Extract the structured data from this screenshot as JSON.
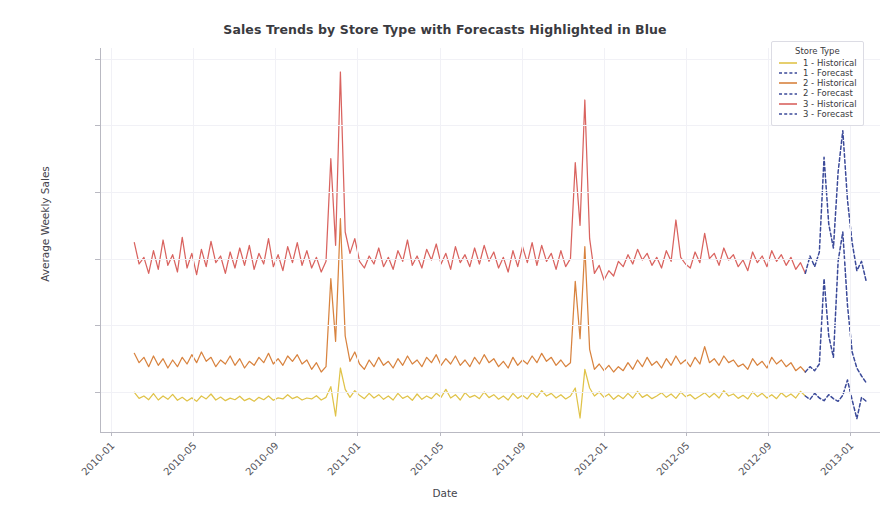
{
  "chart_data": {
    "type": "line",
    "title": "Sales Trends by Store Type with Forecasts Highlighted in Blue",
    "xlabel": "Date",
    "ylabel": "Average Weekly Sales",
    "grid": true,
    "legend_position": "upper right",
    "legend_title": "Store Type",
    "ylim": [
      7000,
      35800
    ],
    "yticks": [
      10000,
      15000,
      20000,
      25000,
      30000,
      35000
    ],
    "ytick_labels": [
      "10000",
      "15000",
      "20000",
      "25000",
      "30000",
      "35000"
    ],
    "xlim": [
      "2009-12-15",
      "2013-02-15"
    ],
    "xticks": [
      "2010-01",
      "2010-05",
      "2010-09",
      "2011-01",
      "2011-05",
      "2011-09",
      "2012-01",
      "2012-05",
      "2012-09",
      "2013-01"
    ],
    "colors": {
      "type1_historical": "#e0c349",
      "type2_historical": "#d8833f",
      "type3_historical": "#d9635f",
      "forecast": "#3b4a99"
    },
    "series": [
      {
        "name": "1 - Historical",
        "store_type": "1",
        "kind": "historical",
        "color": "#e0c349",
        "linestyle": "solid",
        "x_start": "2010-02-05",
        "x_end": "2012-10-26",
        "values": [
          9980,
          9520,
          9700,
          9420,
          9880,
          9400,
          9700,
          9450,
          9820,
          9380,
          9600,
          9330,
          9560,
          9300,
          9700,
          9480,
          9850,
          9400,
          9620,
          9350,
          9540,
          9420,
          9680,
          9350,
          9520,
          9300,
          9600,
          9420,
          9700,
          9380,
          9560,
          9480,
          9800,
          9500,
          9650,
          9400,
          9550,
          9480,
          9720,
          9400,
          9600,
          10400,
          8200,
          11800,
          10200,
          9600,
          10100,
          9750,
          9500,
          9900,
          9550,
          9800,
          9450,
          9700,
          9400,
          9900,
          9520,
          9700,
          9380,
          9850,
          9450,
          9700,
          9500,
          9900,
          9600,
          10200,
          9550,
          9800,
          9400,
          9950,
          9600,
          9750,
          9500,
          10000,
          9580,
          9800,
          9460,
          9700,
          9400,
          9900,
          9520,
          9750,
          9480,
          9950,
          9600,
          10100,
          9700,
          9900,
          9550,
          9800,
          9480,
          9700,
          10300,
          8050,
          11700,
          10300,
          9700,
          10000,
          9600,
          9850,
          9450,
          9750,
          9500,
          9900,
          9550,
          10050,
          9600,
          9800,
          9500,
          9700,
          9950,
          9600,
          9850,
          9520,
          10000,
          9650,
          9800,
          9480,
          9700,
          9950,
          9600,
          9900,
          9550,
          10100,
          9700,
          9850,
          9520,
          9750,
          9480,
          10000,
          9650,
          9900,
          9550,
          9800,
          9500,
          9950,
          9620,
          9850,
          9550,
          10050,
          9700
        ]
      },
      {
        "name": "1 - Forecast",
        "store_type": "1",
        "kind": "forecast",
        "color": "#3b4a99",
        "linestyle": "dashed",
        "x_start": "2012-10-26",
        "x_end": "2013-01-25",
        "values": [
          9700,
          9450,
          9900,
          9550,
          9350,
          9800,
          9500,
          9300,
          9750,
          10900,
          9400,
          8000,
          9600,
          9300
        ]
      },
      {
        "name": "2 - Historical",
        "store_type": "2",
        "kind": "historical",
        "color": "#d8833f",
        "linestyle": "solid",
        "x_start": "2010-02-05",
        "x_end": "2012-10-26",
        "values": [
          12900,
          12200,
          12600,
          11900,
          12700,
          12000,
          12500,
          11800,
          12400,
          11900,
          12600,
          12100,
          12800,
          12200,
          13000,
          12300,
          12600,
          11900,
          12400,
          12100,
          12700,
          12000,
          12500,
          11800,
          12300,
          12000,
          12600,
          12200,
          12900,
          12100,
          12500,
          12000,
          12700,
          12300,
          12800,
          12100,
          12400,
          11700,
          12200,
          11500,
          11900,
          18500,
          13800,
          23000,
          14200,
          12300,
          13000,
          12100,
          11700,
          12400,
          11900,
          12600,
          12000,
          12300,
          11800,
          12500,
          12000,
          12700,
          12100,
          12400,
          11900,
          12600,
          12200,
          12800,
          12000,
          12500,
          12100,
          12700,
          12000,
          12400,
          11900,
          12600,
          12100,
          12800,
          12200,
          12500,
          11900,
          12300,
          11800,
          12600,
          12000,
          12400,
          12100,
          12700,
          12200,
          12900,
          12300,
          12600,
          12000,
          12400,
          11900,
          12200,
          18300,
          14000,
          20900,
          13200,
          11700,
          12100,
          11600,
          12000,
          11500,
          11900,
          11600,
          12200,
          11700,
          12400,
          11900,
          12600,
          12000,
          12300,
          11800,
          12500,
          12000,
          12700,
          12100,
          12400,
          11900,
          12600,
          12100,
          13400,
          12200,
          12500,
          12000,
          12700,
          12200,
          12400,
          11900,
          12100,
          11700,
          12500,
          12000,
          12300,
          11800,
          12600,
          12100,
          12400,
          11900,
          12200,
          11600,
          11900,
          11500
        ]
      },
      {
        "name": "2 - Forecast",
        "store_type": "2",
        "kind": "forecast",
        "color": "#3b4a99",
        "linestyle": "dashed",
        "x_start": "2012-10-26",
        "x_end": "2013-01-25",
        "values": [
          11500,
          11900,
          11600,
          12100,
          18500,
          14200,
          12600,
          19800,
          22000,
          16500,
          13000,
          11800,
          11200,
          10700
        ]
      },
      {
        "name": "3 - Historical",
        "store_type": "3",
        "kind": "historical",
        "color": "#d9635f",
        "linestyle": "solid",
        "x_start": "2010-02-05",
        "x_end": "2012-10-26",
        "values": [
          21200,
          19600,
          20100,
          18900,
          20600,
          19200,
          21400,
          19500,
          20300,
          19000,
          21600,
          19300,
          20400,
          18800,
          20700,
          19400,
          21300,
          19700,
          20200,
          18900,
          20500,
          19300,
          20800,
          19500,
          21000,
          19200,
          20400,
          19600,
          21500,
          19400,
          20300,
          19100,
          20900,
          19700,
          21200,
          19500,
          20600,
          19300,
          20100,
          19000,
          19800,
          27500,
          21000,
          34000,
          22000,
          20400,
          21500,
          19800,
          19300,
          20200,
          19600,
          20800,
          19400,
          20100,
          19200,
          20600,
          19800,
          21400,
          19500,
          20200,
          19300,
          20700,
          19900,
          21100,
          19600,
          20400,
          19200,
          20900,
          19700,
          20300,
          19400,
          20800,
          19600,
          21000,
          19800,
          20500,
          19300,
          20100,
          19000,
          20600,
          19400,
          20900,
          19700,
          21200,
          19500,
          21000,
          19800,
          20400,
          19200,
          20600,
          19400,
          20000,
          27200,
          22500,
          31900,
          21500,
          18900,
          19500,
          18400,
          19100,
          18700,
          19800,
          19400,
          20300,
          19600,
          20700,
          19900,
          20400,
          19500,
          20100,
          19300,
          20600,
          19800,
          22900,
          20100,
          19600,
          19300,
          20500,
          19700,
          21900,
          20000,
          20400,
          19500,
          20800,
          19900,
          20300,
          19400,
          19900,
          19100,
          20500,
          19700,
          20200,
          19400,
          20600,
          19800,
          20300,
          19500,
          20100,
          19200,
          19700,
          18900
        ]
      },
      {
        "name": "3 - Forecast",
        "store_type": "3",
        "kind": "forecast",
        "color": "#3b4a99",
        "linestyle": "dashed",
        "x_start": "2012-10-26",
        "x_end": "2013-01-25",
        "values": [
          18900,
          20200,
          19400,
          20500,
          27600,
          22600,
          20800,
          26500,
          29600,
          24400,
          21200,
          19100,
          19800,
          18300
        ]
      }
    ],
    "annotations": [
      {
        "label": "Holiday spike 2010-12",
        "value": 34000,
        "series": "3 - Historical"
      },
      {
        "label": "Holiday spike 2011-12",
        "value": 31900,
        "series": "3 - Historical"
      }
    ]
  },
  "legend": {
    "title": "Store Type",
    "entries": [
      {
        "label": "1 - Historical",
        "color": "#e0c349",
        "dashed": false
      },
      {
        "label": "1 - Forecast",
        "color": "#3b4a99",
        "dashed": true
      },
      {
        "label": "2 - Historical",
        "color": "#d8833f",
        "dashed": false
      },
      {
        "label": "2 - Forecast",
        "color": "#3b4a99",
        "dashed": true
      },
      {
        "label": "3 - Historical",
        "color": "#d9635f",
        "dashed": false
      },
      {
        "label": "3 - Forecast",
        "color": "#3b4a99",
        "dashed": true
      }
    ]
  }
}
